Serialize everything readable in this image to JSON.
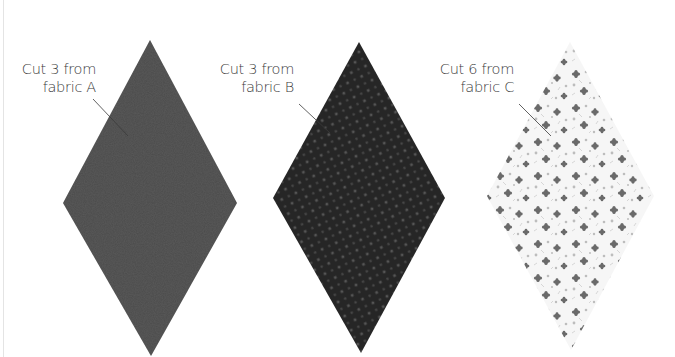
{
  "pieces": [
    {
      "id": "A",
      "line1": "Cut 3 from",
      "line2": "fabric A",
      "fabric_name": "fabric A",
      "quantity": 3,
      "shape": "diamond",
      "fabric_color": "#4a4a4a",
      "pattern": "solid-textured"
    },
    {
      "id": "B",
      "line1": "Cut 3 from",
      "line2": "fabric B",
      "fabric_name": "fabric B",
      "quantity": 3,
      "shape": "diamond",
      "fabric_color": "#2a2a2a",
      "pattern": "small-dots"
    },
    {
      "id": "C",
      "line1": "Cut 6 from",
      "line2": "fabric C",
      "fabric_name": "fabric C",
      "quantity": 6,
      "shape": "diamond",
      "fabric_color": "#f4f4f4",
      "pattern": "floral-print"
    }
  ]
}
